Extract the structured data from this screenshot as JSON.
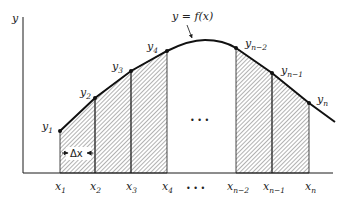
{
  "diagram": {
    "type": "trapezoidal-rule",
    "axis_labels": {
      "y": "y"
    },
    "curve_label": "y = f(x)",
    "delta_label": "Δx",
    "ellipsis": "• • •",
    "colors": {
      "ink": "#1a1a1a",
      "hatch": "#555555",
      "background": "#ffffff"
    },
    "x_ticks": [
      {
        "base": "x",
        "sub": "1"
      },
      {
        "base": "x",
        "sub": "2"
      },
      {
        "base": "x",
        "sub": "3"
      },
      {
        "base": "x",
        "sub": "4"
      },
      {
        "base": "x",
        "sub": "n−2"
      },
      {
        "base": "x",
        "sub": "n−1"
      },
      {
        "base": "x",
        "sub": "n"
      }
    ],
    "y_points": [
      {
        "base": "y",
        "sub": "1"
      },
      {
        "base": "y",
        "sub": "2"
      },
      {
        "base": "y",
        "sub": "3"
      },
      {
        "base": "y",
        "sub": "4"
      },
      {
        "base": "y",
        "sub": "n−2"
      },
      {
        "base": "y",
        "sub": "n−1"
      },
      {
        "base": "y",
        "sub": "n"
      }
    ]
  }
}
